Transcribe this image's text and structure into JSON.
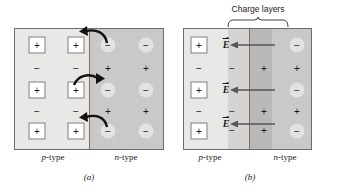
{
  "figure": {
    "panel_a": {
      "letter": "(a)",
      "left_label": "p-type",
      "right_label": "n-type",
      "left_region": {
        "name": "p-type region",
        "fill": "#e8e8e6",
        "majority_symbol": "−",
        "fixed_symbol": "+",
        "fixed_enclosure": "square"
      },
      "right_region": {
        "name": "n-type region",
        "fill": "#c9c9c7",
        "majority_symbol": "+",
        "fixed_symbol": "−",
        "fixed_enclosure": "circle"
      },
      "diffusion_arrows": [
        {
          "row": 1,
          "direction": "left"
        },
        {
          "row": 2,
          "direction": "right"
        },
        {
          "row": 3,
          "direction": "left"
        }
      ]
    },
    "panel_b": {
      "letter": "(b)",
      "left_label": "p-type",
      "right_label": "n-type",
      "annotation": "Charge layers",
      "field_label": "E",
      "field_direction": "left",
      "bands": [
        {
          "name": "p-type bulk",
          "fill": "#e8e8e6"
        },
        {
          "name": "negative charge layer",
          "fill": "#d4d4d2"
        },
        {
          "name": "positive charge layer",
          "fill": "#b9b9b7"
        },
        {
          "name": "n-type bulk",
          "fill": "#c9c9c7"
        }
      ],
      "field_rows": 3
    }
  },
  "colors": {
    "panel_border": "#6d6d6d",
    "junction_line": "#8a6a5a",
    "arrow": "#1a1a1a",
    "field_arrow": "#55555a"
  },
  "side_caption": {
    "visible": false,
    "note": "truncated body text at right edge, illegible"
  }
}
